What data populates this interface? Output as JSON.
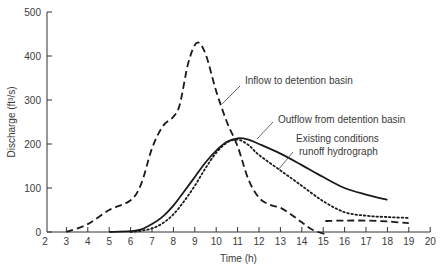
{
  "chart_data": {
    "type": "line",
    "title": "",
    "xlabel": "Time (h)",
    "ylabel": "Discharge (ft³/s)",
    "xlim": [
      2,
      20
    ],
    "ylim": [
      0,
      500
    ],
    "x_ticks": [
      2,
      3,
      4,
      5,
      6,
      7,
      8,
      9,
      10,
      11,
      12,
      13,
      14,
      15,
      16,
      17,
      18,
      19,
      20
    ],
    "y_ticks": [
      0,
      100,
      200,
      300,
      400,
      500
    ],
    "grid": false,
    "legend": "none (annotations with leader lines)",
    "series": [
      {
        "name": "Inflow to detention basin",
        "style": "dashed",
        "points": [
          [
            3,
            0
          ],
          [
            4,
            18
          ],
          [
            5,
            50
          ],
          [
            6,
            72
          ],
          [
            6.5,
            110
          ],
          [
            7,
            190
          ],
          [
            7.5,
            240
          ],
          [
            8,
            262
          ],
          [
            8.3,
            290
          ],
          [
            8.7,
            385
          ],
          [
            9.1,
            430
          ],
          [
            9.5,
            405
          ],
          [
            10,
            320
          ],
          [
            10.5,
            250
          ],
          [
            11,
            195
          ],
          [
            11.5,
            120
          ],
          [
            12,
            78
          ],
          [
            12.5,
            62
          ],
          [
            13,
            55
          ],
          [
            13.5,
            40
          ],
          [
            14,
            22
          ],
          [
            14.5,
            5
          ],
          [
            15.1,
            -5
          ]
        ]
      },
      {
        "name": "Outflow from detention basin",
        "style": "solid",
        "points": [
          [
            5,
            0
          ],
          [
            6,
            2
          ],
          [
            6.5,
            6
          ],
          [
            7,
            18
          ],
          [
            7.5,
            35
          ],
          [
            8,
            60
          ],
          [
            8.5,
            92
          ],
          [
            9,
            125
          ],
          [
            9.5,
            158
          ],
          [
            10,
            185
          ],
          [
            10.5,
            205
          ],
          [
            11,
            213
          ],
          [
            11.5,
            210
          ],
          [
            12,
            200
          ],
          [
            13,
            178
          ],
          [
            14,
            152
          ],
          [
            15,
            125
          ],
          [
            16,
            100
          ],
          [
            17,
            85
          ],
          [
            18,
            73
          ]
        ]
      },
      {
        "name": "Existing conditions runoff hydrograph",
        "style": "dotted",
        "points": [
          [
            6,
            0
          ],
          [
            6.5,
            3
          ],
          [
            7,
            8
          ],
          [
            7.5,
            20
          ],
          [
            8,
            40
          ],
          [
            8.5,
            70
          ],
          [
            9,
            105
          ],
          [
            9.5,
            145
          ],
          [
            10,
            180
          ],
          [
            10.5,
            203
          ],
          [
            11,
            210
          ],
          [
            11.5,
            198
          ],
          [
            12,
            175
          ],
          [
            13,
            140
          ],
          [
            14,
            105
          ],
          [
            15,
            70
          ],
          [
            16,
            45
          ],
          [
            17,
            37
          ],
          [
            18,
            34
          ],
          [
            19,
            32
          ]
        ]
      },
      {
        "name": "Inflow tail (dashed)",
        "style": "dashed",
        "points": [
          [
            15.1,
            25
          ],
          [
            16,
            26
          ],
          [
            17,
            26
          ],
          [
            18,
            24
          ],
          [
            19,
            20
          ]
        ]
      }
    ],
    "annotations": [
      {
        "text": "Inflow to detention basin",
        "points_to_series": "Inflow to detention basin"
      },
      {
        "text": "Outflow from detention basin",
        "points_to_series": "Outflow from detention basin"
      },
      {
        "text": "Existing conditions runoff hydrograph",
        "points_to_series": "Existing conditions runoff hydrograph"
      }
    ]
  },
  "labels": {
    "xlabel": "Time (h)",
    "ylabel": "Discharge (ft³/s)",
    "annot_inflow": "Inflow to detention basin",
    "annot_outflow": "Outflow from detention basin",
    "annot_existing_1": "Existing conditions",
    "annot_existing_2": "runoff hydrograph"
  },
  "colors": {
    "line": "#1a1a1a",
    "text": "#3a3a3a",
    "axis": "#333333"
  }
}
